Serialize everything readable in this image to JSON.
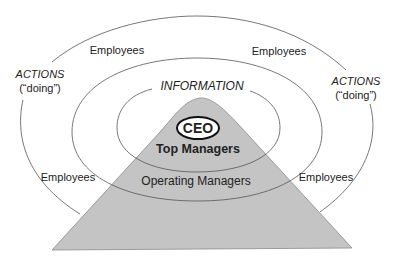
{
  "diagram": {
    "type": "concentric-circles-over-pyramid",
    "center": {
      "ceo_label": "CEO",
      "top_managers_label": "Top Managers"
    },
    "middle_ring": {
      "label": "INFORMATION",
      "operating_managers_label": "Operating Managers"
    },
    "outer_ring": {
      "employees_top_left": "Employees",
      "employees_top_right": "Employees",
      "employees_bottom_left": "Employees",
      "employees_bottom_right": "Employees"
    },
    "side_labels": {
      "left_actions": "ACTIONS",
      "left_doing": "(“doing”)",
      "right_actions": "ACTIONS",
      "right_doing": "(“doing”)"
    },
    "colors": {
      "pyramid_fill": "#c4c4c4",
      "line": "#555555",
      "text": "#222222",
      "background": "#ffffff"
    }
  }
}
